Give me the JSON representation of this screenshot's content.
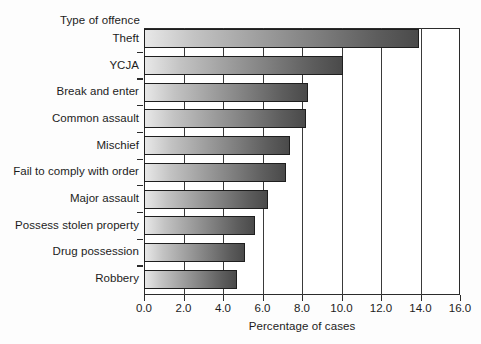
{
  "chart_data": {
    "type": "bar",
    "orientation": "horizontal",
    "title": "",
    "xlabel": "Percentage of cases",
    "ylabel": "Type of offence",
    "xlim": [
      0.0,
      16.0
    ],
    "xticks": [
      "0.0",
      "2.0",
      "4.0",
      "6.0",
      "8.0",
      "10.0",
      "12.0",
      "14.0",
      "16.0"
    ],
    "xtick_values": [
      0,
      2,
      4,
      6,
      8,
      10,
      12,
      14,
      16
    ],
    "grid": true,
    "grid_axis": "x",
    "legend": "none",
    "categories": [
      "Theft",
      "YCJA",
      "Break and enter",
      "Common assault",
      "Mischief",
      "Fail to comply with order",
      "Major assault",
      "Possess stolen property",
      "Drug possession",
      "Robbery"
    ],
    "values": [
      13.9,
      10.1,
      8.3,
      8.2,
      7.4,
      7.2,
      6.3,
      5.6,
      5.1,
      4.7
    ],
    "bar_style": {
      "fill": "horizontal-gradient-gray",
      "gradient_start": "#e8e8e8",
      "gradient_end": "#4a4a4a",
      "edge_color": "#1e1e1e"
    }
  },
  "colors": {
    "background": "#fdfdfd",
    "axis": "#2b2b2b",
    "text": "#1c1c1c",
    "gridline": "#3a3a3a"
  }
}
